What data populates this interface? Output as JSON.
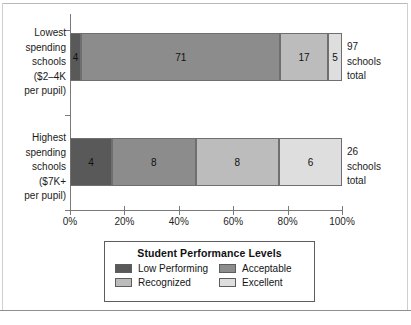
{
  "chart_data": {
    "type": "bar",
    "orientation": "horizontal",
    "stacked": true,
    "normalized_percent": true,
    "title": "",
    "xlabel": "",
    "ylabel": "",
    "xlim": [
      0,
      100
    ],
    "grid": false,
    "legend_position": "bottom",
    "legend_title": "Student Performance Levels",
    "categories": [
      "Lowest spending schools ($2–4K per pupil)",
      "Highest spending schools ($7K+ per pupil)"
    ],
    "tick_labels": [
      "0%",
      "20%",
      "40%",
      "60%",
      "80%",
      "100%"
    ],
    "tick_values": [
      0,
      20,
      40,
      60,
      80,
      100
    ],
    "series": [
      {
        "name": "Low Performing",
        "color": "#595959",
        "values": [
          4,
          4
        ]
      },
      {
        "name": "Acceptable",
        "color": "#8c8c8c",
        "values": [
          71,
          8
        ]
      },
      {
        "name": "Recognized",
        "color": "#bcbcbc",
        "values": [
          17,
          8
        ]
      },
      {
        "name": "Excellent",
        "color": "#dedede",
        "values": [
          5,
          6
        ]
      }
    ],
    "row_totals": [
      97,
      26
    ],
    "total_suffix": "schools total"
  },
  "axis": {
    "ticks": [
      {
        "label": "0%",
        "value": 0
      },
      {
        "label": "20%",
        "value": 20
      },
      {
        "label": "40%",
        "value": 40
      },
      {
        "label": "60%",
        "value": 60
      },
      {
        "label": "80%",
        "value": 80
      },
      {
        "label": "100%",
        "value": 100
      }
    ]
  },
  "rows": [
    {
      "label_lines": [
        "Lowest",
        "spending",
        "schools",
        "($2–4K",
        "per pupil)"
      ],
      "total_lines": [
        "97",
        "schools",
        "total"
      ],
      "segments": [
        {
          "label": "4",
          "value": 4,
          "level": "Low Performing",
          "shade": "dark"
        },
        {
          "label": "71",
          "value": 71,
          "level": "Acceptable",
          "shade": "med"
        },
        {
          "label": "17",
          "value": 17,
          "level": "Recognized",
          "shade": "light"
        },
        {
          "label": "5",
          "value": 5,
          "level": "Excellent",
          "shade": "pale"
        }
      ]
    },
    {
      "label_lines": [
        "Highest",
        "spending",
        "schools",
        "($7K+",
        "per pupil)"
      ],
      "total_lines": [
        "26",
        "schools",
        "total"
      ],
      "segments": [
        {
          "label": "4",
          "value": 4,
          "level": "Low Performing",
          "shade": "dark"
        },
        {
          "label": "8",
          "value": 8,
          "level": "Acceptable",
          "shade": "med"
        },
        {
          "label": "8",
          "value": 8,
          "level": "Recognized",
          "shade": "light"
        },
        {
          "label": "6",
          "value": 6,
          "level": "Excellent",
          "shade": "pale"
        }
      ]
    }
  ],
  "legend": {
    "title": "Student Performance Levels",
    "items": [
      {
        "label": "Low Performing",
        "shade": "dark"
      },
      {
        "label": "Acceptable",
        "shade": "med"
      },
      {
        "label": "Recognized",
        "shade": "light"
      },
      {
        "label": "Excellent",
        "shade": "pale"
      }
    ]
  }
}
